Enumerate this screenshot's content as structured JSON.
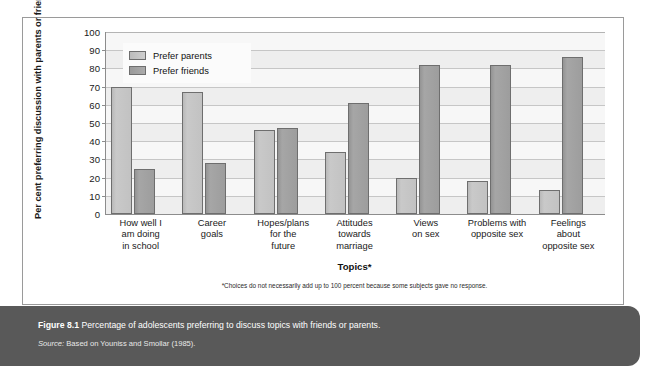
{
  "chart_data": {
    "type": "bar",
    "title": "",
    "xlabel": "Topics*",
    "ylabel": "Per cent preferring discussion with parents or friends",
    "ylim": [
      0,
      100
    ],
    "ytick_step": 10,
    "grid": true,
    "legend_position": "top-left-inside",
    "categories": [
      "How well I am doing in school",
      "Career goals",
      "Hopes/plans for the future",
      "Attitudes towards marriage",
      "Views on sex",
      "Problems with opposite sex",
      "Feelings about opposite sex"
    ],
    "category_lines": [
      [
        "How well I",
        "am doing",
        "in school"
      ],
      [
        "Career",
        "goals"
      ],
      [
        "Hopes/plans",
        "for the",
        "future"
      ],
      [
        "Attitudes",
        "towards",
        "marriage"
      ],
      [
        "Views",
        "on sex"
      ],
      [
        "Problems with",
        "opposite sex"
      ],
      [
        "Feelings",
        "about",
        "opposite sex"
      ]
    ],
    "series": [
      {
        "name": "Prefer parents",
        "color": "#c4c4c4",
        "values": [
          70,
          67,
          46,
          34,
          20,
          18,
          13
        ]
      },
      {
        "name": "Prefer friends",
        "color": "#9d9d9d",
        "values": [
          25,
          28,
          47,
          61,
          82,
          82,
          86
        ]
      }
    ],
    "ytick_labels": [
      "100",
      "90",
      "80",
      "70",
      "60",
      "50",
      "40",
      "30",
      "20",
      "10",
      "0"
    ],
    "footnote": "*Choices do not necessarily add up to 100 percent because some subjects gave no response."
  },
  "legend": {
    "items": [
      {
        "label": "Prefer parents"
      },
      {
        "label": "Prefer friends"
      }
    ]
  },
  "caption": {
    "figure_number": "Figure 8.1",
    "text": "Percentage of adolescents preferring to discuss topics with friends or parents.",
    "source_word": "Source:",
    "source_text": "Based on Youniss and Smollar (1985)."
  }
}
